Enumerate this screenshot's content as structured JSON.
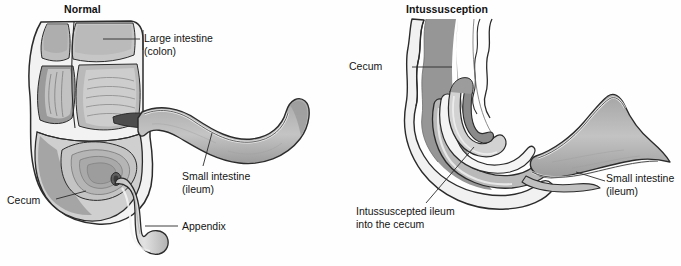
{
  "figure": {
    "background_color": "#fefefe",
    "line_color": "#2b2b2b",
    "tissue_light": "#d9d9d9",
    "tissue_mid": "#b8b8b8",
    "tissue_dark": "#8f8f8f",
    "tissue_darkest": "#6e6e6e",
    "wall_color": "#efefef"
  },
  "panels": [
    {
      "id": "normal",
      "title": "Normal",
      "labels": [
        {
          "name": "large-intestine",
          "line1": "Large intestine",
          "line2": "(colon)"
        },
        {
          "name": "small-intestine",
          "line1": "Small intestine",
          "line2": "(ileum)"
        },
        {
          "name": "cecum",
          "line1": "Cecum",
          "line2": ""
        },
        {
          "name": "appendix",
          "line1": "Appendix",
          "line2": ""
        }
      ]
    },
    {
      "id": "intussusception",
      "title": "Intussusception",
      "labels": [
        {
          "name": "cecum",
          "line1": "Cecum",
          "line2": ""
        },
        {
          "name": "intussuscepted-ileum",
          "line1": "Intussuscepted ileum",
          "line2": "into the cecum"
        },
        {
          "name": "small-intestine",
          "line1": "Small intestine",
          "line2": "(ileum)"
        }
      ]
    }
  ]
}
